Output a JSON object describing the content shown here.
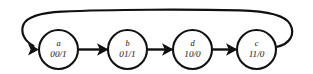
{
  "figure": {
    "kind": "state-transition-diagram",
    "background_color": "#ffffff",
    "ink_color": "#111111",
    "width": 313,
    "height": 74
  },
  "nodes": [
    {
      "id": "a",
      "state_label": "a",
      "code_label": "00/1",
      "cx": 58.5,
      "cy": 49.5,
      "r": 19.5
    },
    {
      "id": "b",
      "state_label": "b",
      "code_label": "01/1",
      "cx": 127.5,
      "cy": 49.5,
      "r": 19.5
    },
    {
      "id": "d",
      "state_label": "d",
      "code_label": "10/0",
      "cx": 192.5,
      "cy": 49.5,
      "r": 19.5
    },
    {
      "id": "c",
      "state_label": "c",
      "code_label": "11/0",
      "cx": 256.5,
      "cy": 49.5,
      "r": 19.5
    }
  ],
  "edges": [
    {
      "id": "a-to-b",
      "from": "a",
      "to": "b",
      "style": "straight"
    },
    {
      "id": "b-to-d",
      "from": "b",
      "to": "d",
      "style": "straight"
    },
    {
      "id": "d-to-c",
      "from": "d",
      "to": "c",
      "style": "straight"
    },
    {
      "id": "c-to-a",
      "from": "c",
      "to": "a",
      "style": "feedback-arc-over-top"
    }
  ],
  "geometry": {
    "edge_a_b": {
      "x1": 78.5,
      "x2": 105.5,
      "y": 49.5
    },
    "edge_b_d": {
      "x1": 147.5,
      "x2": 170.5,
      "y": 49.5
    },
    "edge_d_c": {
      "x1": 212.5,
      "x2": 234.5,
      "y": 49.5
    },
    "arrowheads": [
      {
        "id": "arrow-into-a",
        "tip_x": 39.0,
        "tip_y": 49.5
      },
      {
        "id": "arrow-into-b",
        "tip_x": 108.0,
        "tip_y": 49.5
      },
      {
        "id": "arrow-into-d",
        "tip_x": 173.0,
        "tip_y": 49.5
      },
      {
        "id": "arrow-into-c",
        "tip_x": 237.0,
        "tip_y": 49.5
      }
    ],
    "feedback_path": "M 276.2 47.0 C 290.5 44.0 295.5 34.0 290.0 24.0 C 285.0 15.0 268.0 11.2 240.0 10.4 C 190.0 9.2 110.0 9.4 62.0 11.6 C 40.0 12.8 27.0 16.5 23.5 24.5 C 20.0 32.5 24.5 41.0 33.5 46.0"
  }
}
